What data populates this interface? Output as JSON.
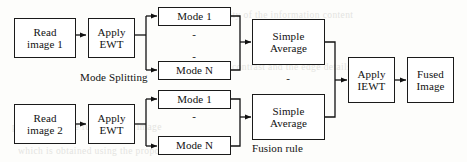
{
  "figure": {
    "type": "flowchart",
    "orientation": "left-to-right",
    "stroke_color": "#1a1a1a",
    "fill_color": "#ffffff",
    "background_color": "#fdfdfb"
  },
  "nodes": {
    "read_image_1": "Read\nimage 1",
    "read_image_1_line1": "Read",
    "read_image_1_line2": "image 1",
    "apply_ewt_1_line1": "Apply",
    "apply_ewt_1_line2": "EWT",
    "mode_1_top": "Mode 1",
    "mode_n_top": "Mode N",
    "simple_average_top_line1": "Simple",
    "simple_average_top_line2": "Average",
    "read_image_2_line1": "Read",
    "read_image_2_line2": "image 2",
    "apply_ewt_2_line1": "Apply",
    "apply_ewt_2_line2": "EWT",
    "mode_1_bottom": "Mode 1",
    "mode_n_bottom": "Mode N",
    "simple_average_bottom_line1": "Simple",
    "simple_average_bottom_line2": "Average",
    "apply_iewt_line1": "Apply",
    "apply_iewt_line2": "IEWT",
    "fused_image_line1": "Fused",
    "fused_image_line2": "Image"
  },
  "captions": {
    "mode_splitting": "Mode Splitting",
    "fusion_rule": "Fusion rule"
  },
  "ellipsis": {
    "dot": "-"
  },
  "ghost_text": {
    "rows": [
      "the quality of the information content",
      "contrast and the edge details are",
      "preserved in the fused output image",
      "which is obtained using the proposed"
    ]
  }
}
